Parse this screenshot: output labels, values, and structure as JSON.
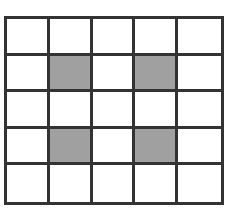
{
  "figure": {
    "kind": "grid-diagram",
    "title": "",
    "background_color": "#ffffff"
  },
  "grid": {
    "rows": 5,
    "columns": 5,
    "line_color": "#333333",
    "line_width_px": 3,
    "empty_cell_color": "#ffffff",
    "shaded_cell_color": "#a0a0a0",
    "bounds": {
      "left_px": 4,
      "top_px": 16,
      "right_px": 224,
      "bottom_px": 205
    },
    "shaded_cells": [
      {
        "row": 1,
        "col": 1
      },
      {
        "row": 1,
        "col": 3
      },
      {
        "row": 3,
        "col": 1
      },
      {
        "row": 3,
        "col": 3
      }
    ],
    "shaded_count": 4,
    "total_cells": 25,
    "cells": [
      [
        false,
        false,
        false,
        false,
        false
      ],
      [
        false,
        true,
        false,
        true,
        false
      ],
      [
        false,
        false,
        false,
        false,
        false
      ],
      [
        false,
        true,
        false,
        true,
        false
      ],
      [
        false,
        false,
        false,
        false,
        false
      ]
    ]
  }
}
